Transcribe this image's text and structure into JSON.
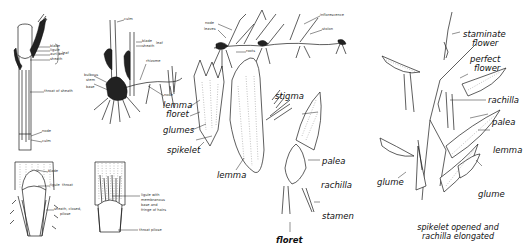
{
  "figures": {
    "culm_leaf": {
      "labels": {
        "blade": "blade",
        "ligule": "ligule",
        "auricles": "auricles",
        "sheath": "sheath",
        "leaf": "leaf",
        "throat": "throat of sheath",
        "node": "node",
        "culm": "culm"
      }
    },
    "ligule_closeup": {
      "labels": {
        "blade": "blade",
        "ligule": "ligule",
        "throat": "throat",
        "sheath": "sheath, closed,",
        "pilose": "pilose"
      }
    },
    "rhizome_plant": {
      "labels": {
        "culm": "culm",
        "blade": "blade",
        "sheath": "sheath",
        "leaf": "leaf",
        "rhizome": "rhizome",
        "bulbous": "bulbous",
        "stem": "stem",
        "base": "base",
        "node": "node"
      }
    },
    "hairy_ligule": {
      "labels": {
        "line1": "ligule with",
        "line2": "membranous",
        "line3": "base and",
        "line4": "fringe of hairs",
        "throat": "throat pilose"
      }
    },
    "stolon_plant": {
      "labels": {
        "node": "node",
        "leaves": "leaves",
        "inflorescence": "inflorescence",
        "stolon": "stolon",
        "roots": "roots"
      }
    },
    "spikelet": {
      "labels": {
        "lemma_top": "lemma",
        "floret_top": "floret",
        "glumes": "glumes",
        "spikelet": "spikelet",
        "lemma": "lemma",
        "stigma": "stigma",
        "palea": "palea",
        "rachilla": "rachilla",
        "stamen": "stamen",
        "floret": "floret"
      }
    },
    "spikelet_opened": {
      "labels": {
        "staminate1": "staminate",
        "staminate2": "flower",
        "perfect1": "perfect",
        "perfect2": "flower",
        "rachilla": "rachilla",
        "palea": "palea",
        "lemma": "lemma",
        "glume_left": "glume",
        "glume_right": "glume"
      },
      "caption_line1": "spikelet opened and",
      "caption_line2": "rachilla elongated"
    }
  }
}
